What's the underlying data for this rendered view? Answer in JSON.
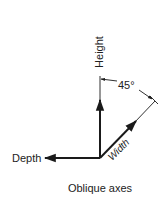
{
  "diagram": {
    "title": "Oblique axes",
    "axes": {
      "height": {
        "label": "Height",
        "direction": "vertical-up"
      },
      "width": {
        "label": "Width",
        "direction": "diagonal-up-right"
      },
      "depth": {
        "label": "Depth",
        "direction": "horizontal-left"
      }
    },
    "angle": {
      "label": "45°",
      "between": [
        "height",
        "width"
      ]
    },
    "colors": {
      "stroke": "#1a1a1a",
      "text": "#222222",
      "background": "#ffffff"
    }
  }
}
